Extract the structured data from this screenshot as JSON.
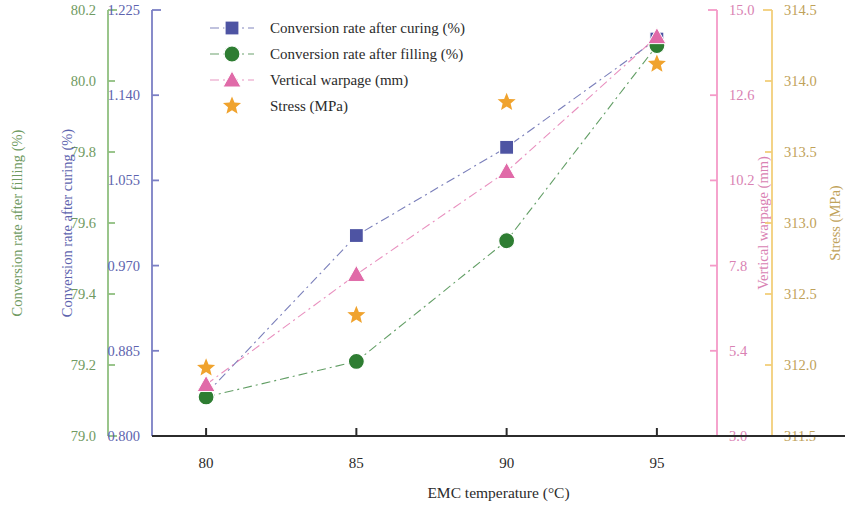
{
  "chart_data": {
    "type": "line",
    "title": "",
    "subtitle": "",
    "xlabel": "EMC temperature (°C)",
    "x": [
      80,
      85,
      90,
      95
    ],
    "xtick_labels": [
      "80",
      "85",
      "90",
      "95"
    ],
    "xlim": [
      78.2,
      97.0
    ],
    "grid": false,
    "legend_position": "top-center",
    "series": [
      {
        "name": "Conversion rate after curing (%)",
        "label": "Conversion rate after curing (%)",
        "axis": "y-left-inner",
        "marker": "square",
        "color": "#4e54a3",
        "linestyle": "dash-dot",
        "values": [
          0.842,
          1.0,
          1.088,
          1.196
        ],
        "units": "%"
      },
      {
        "name": "Conversion rate after filling (%)",
        "label": "Conversion rate after filling (%)",
        "axis": "y-left-outer",
        "marker": "circle",
        "color": "#2e7d32",
        "linestyle": "dash-dot",
        "values": [
          79.11,
          79.21,
          79.55,
          80.1
        ],
        "units": "%"
      },
      {
        "name": "Vertical warpage (mm)",
        "label": "Vertical warpage (mm)",
        "axis": "y-right-inner",
        "marker": "triangle",
        "color": "#e06aa8",
        "linestyle": "dash-dot",
        "values": [
          4.45,
          7.55,
          10.45,
          14.25
        ],
        "units": "mm"
      },
      {
        "name": "Stress (MPa)",
        "label": "Stress (MPa)",
        "axis": "y-right-outer",
        "marker": "star",
        "color": "#f0a32e",
        "linestyle": "none",
        "values": [
          311.98,
          312.35,
          313.85,
          314.12
        ],
        "units": "MPa"
      }
    ],
    "axes": [
      {
        "id": "y-left-outer",
        "title": "Conversion rate after filling (%)",
        "color": "#8fbf7f",
        "label_color": "#6f9a62",
        "ticks": [
          "80.2",
          "80.0",
          "79.8",
          "79.6",
          "79.4",
          "79.2",
          "79.0"
        ],
        "tick_values": [
          80.2,
          80.0,
          79.8,
          79.6,
          79.4,
          79.2,
          79.0
        ],
        "ylim": [
          79.0,
          80.2
        ]
      },
      {
        "id": "y-left-inner",
        "title": "Conversion rate after curing (%)",
        "color": "#7b7fc4",
        "label_color": "#5d63ae",
        "ticks": [
          "1.225",
          "1.140",
          "1.055",
          "0.970",
          "0.885",
          "0.800"
        ],
        "tick_values": [
          1.225,
          1.14,
          1.055,
          0.97,
          0.885,
          0.8
        ],
        "ylim": [
          0.8,
          1.225
        ]
      },
      {
        "id": "y-right-inner",
        "title": "Vertical warpage (mm)",
        "color": "#f49ac8",
        "label_color": "#d982b3",
        "ticks": [
          "15.0",
          "12.6",
          "10.2",
          "7.8",
          "5.4",
          "3.0"
        ],
        "tick_values": [
          15.0,
          12.6,
          10.2,
          7.8,
          5.4,
          3.0
        ],
        "ylim": [
          3.0,
          15.0
        ]
      },
      {
        "id": "y-right-outer",
        "title": "Stress (MPa)",
        "color": "#f2cf7a",
        "label_color": "#bfa25a",
        "ticks": [
          "314.5",
          "314.0",
          "313.5",
          "313.0",
          "312.5",
          "312.0",
          "311.5"
        ],
        "tick_values": [
          314.5,
          314.0,
          313.5,
          313.0,
          312.5,
          312.0,
          311.5
        ],
        "ylim": [
          311.5,
          314.5
        ]
      }
    ]
  },
  "legend": {
    "items": [
      {
        "label": "Conversion rate after curing (%)",
        "color": "#4e54a3",
        "marker": "square"
      },
      {
        "label": "Conversion rate after filling (%)",
        "color": "#2e7d32",
        "marker": "circle"
      },
      {
        "label": "Vertical warpage (mm)",
        "color": "#e06aa8",
        "marker": "triangle"
      },
      {
        "label": "Stress (MPa)",
        "color": "#f0a32e",
        "marker": "star"
      }
    ]
  },
  "xaxis": {
    "title": "EMC temperature (°C)",
    "ticks": [
      "80",
      "85",
      "90",
      "95"
    ]
  },
  "ytitles": {
    "filling": "Conversion rate after filling (%)",
    "curing": "Conversion rate after curing (%)",
    "warpage": "Vertical warpage (mm)",
    "stress": "Stress (MPa)"
  },
  "yticks": {
    "filling": [
      "80.2",
      "80.0",
      "79.8",
      "79.6",
      "79.4",
      "79.2",
      "79.0"
    ],
    "curing": [
      "1.225",
      "1.140",
      "1.055",
      "0.970",
      "0.885",
      "0.800"
    ],
    "warpage": [
      "15.0",
      "12.6",
      "10.2",
      "7.8",
      "5.4",
      "3.0"
    ],
    "stress": [
      "314.5",
      "314.0",
      "313.5",
      "313.0",
      "312.5",
      "312.0",
      "311.5"
    ]
  },
  "colors": {
    "curing_axis": "#7b7fc4",
    "filling_axis": "#8fbf7f",
    "warpage_axis": "#f49ac8",
    "stress_axis": "#f2cf7a",
    "curing_marker": "#4e54a3",
    "filling_marker": "#2e7d32",
    "warpage_marker": "#e06aa8",
    "stress_marker": "#f0a32e",
    "xaxis": "#2b2b2b"
  }
}
